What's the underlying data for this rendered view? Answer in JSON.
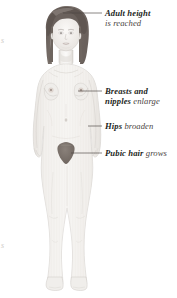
{
  "diagram": {
    "background_color": "#ffffff",
    "skin_color": "#f3f1ee",
    "skin_outline_color": "#c9c5c1",
    "skin_shade_color": "#e4e1dd",
    "hair_color": "#6e6560",
    "hair_highlight_color": "#8d847e",
    "pubic_hair_color": "#7a716b",
    "leader_line_color": "#4a4542",
    "label_text_color": "#231f1c"
  },
  "labels": [
    {
      "id": "adult-height",
      "line1": "Adult height",
      "line2": "is reached",
      "line1_style": "bold-italic",
      "line2_style": "italic",
      "leader_from": "top-of-head",
      "leader_x_start": 63,
      "leader_x_end": 102,
      "leader_y": 13
    },
    {
      "id": "breasts-nipples",
      "line1": "Breasts and",
      "line2_strong": "nipples",
      "line2_light": "enlarge",
      "line1_style": "bold-italic",
      "leader_from": "right-breast",
      "leader_x_start": 78,
      "leader_x_end": 102,
      "leader_y": 91
    },
    {
      "id": "hips-broaden",
      "strong": "Hips",
      "light": "broaden",
      "leader_from": "right-hip",
      "leader_x_start": 88,
      "leader_x_end": 102,
      "leader_y": 126
    },
    {
      "id": "pubic-hair",
      "strong": "Pubic hair",
      "light": "grows",
      "leader_from": "pubic-region",
      "leader_x_start": 71,
      "leader_x_end": 102,
      "leader_y": 153
    }
  ],
  "edge_fragments": {
    "top": "s",
    "bottom": "s"
  }
}
